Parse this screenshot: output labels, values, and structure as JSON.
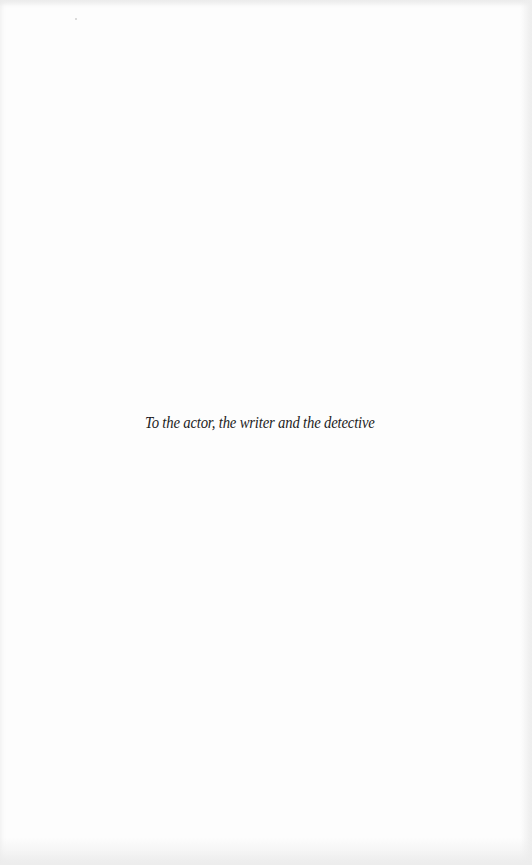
{
  "page": {
    "type": "dedication",
    "background_color": "#fdfdfd",
    "text_color": "#1e1e1e"
  },
  "dedication": {
    "text": "To the actor, the writer and the detective"
  }
}
